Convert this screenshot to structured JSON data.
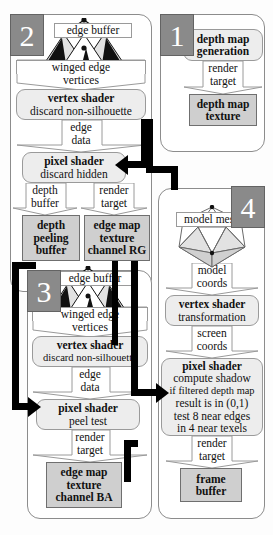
{
  "diagram": {
    "colors": {
      "stage_tab": "#8a8a8a",
      "buffer_fill": "#cfcfcf",
      "process_fill": "#ededed",
      "arrow": "#000000",
      "panel_border": "#8c8c8c"
    },
    "stages": [
      {
        "id": "stage-1",
        "number": "1"
      },
      {
        "id": "stage-2",
        "number": "2"
      },
      {
        "id": "stage-3",
        "number": "3"
      },
      {
        "id": "stage-4",
        "number": "4"
      }
    ]
  },
  "stage1": {
    "number": "1",
    "process": {
      "title": "depth map",
      "subtitle": "generation"
    },
    "connector": {
      "line1": "render",
      "line2": "target"
    },
    "buffer": {
      "line1": "depth map",
      "line2": "texture"
    }
  },
  "stage2": {
    "number": "2",
    "edge_buffer_label": "edge buffer",
    "mesh_label_1": "winged edge",
    "mesh_label_2": "vertices",
    "vertex_shader": {
      "title": "vertex shader",
      "subtitle": "discard non-silhouette"
    },
    "connector_edge": {
      "line1": "edge",
      "line2": "data"
    },
    "pixel_shader": {
      "title": "pixel shader",
      "subtitle": "discard hidden"
    },
    "connector_depth": {
      "line1": "depth",
      "line2": "buffer"
    },
    "connector_render": {
      "line1": "render",
      "line2": "target"
    },
    "buffer_depth_peeling": {
      "line1": "depth",
      "line2": "peeling",
      "line3": "buffer"
    },
    "buffer_edge_map_rg": {
      "line1": "edge map",
      "line2": "texture",
      "line3": "channel RG"
    }
  },
  "stage3": {
    "number": "3",
    "edge_buffer_label": "edge buffer",
    "mesh_label_1": "winged edge",
    "mesh_label_2": "vertices",
    "vertex_shader": {
      "title": "vertex shader",
      "subtitle": "discard non-silhouette"
    },
    "connector_edge": {
      "line1": "edge",
      "line2": "data"
    },
    "pixel_shader": {
      "title": "pixel shader",
      "subtitle": "peel test"
    },
    "connector_render": {
      "line1": "render",
      "line2": "target"
    },
    "buffer_edge_map_ba": {
      "line1": "edge map",
      "line2": "texture",
      "line3": "channel BA"
    }
  },
  "stage4": {
    "number": "4",
    "model_mesh_label": "model mesh",
    "connector_model": {
      "line1": "model",
      "line2": "coords"
    },
    "vertex_shader": {
      "title": "vertex shader",
      "subtitle": "transformation"
    },
    "connector_screen": {
      "line1": "screen",
      "line2": "coords"
    },
    "pixel_shader": {
      "title": "pixel shader",
      "line1": "compute shadow",
      "line2": "if filtered depth map",
      "line3": "result is in (0,1)",
      "line4": "test 8 near edges",
      "line5": "in 4 near texels"
    },
    "connector_render": {
      "line1": "render",
      "line2": "target"
    },
    "buffer_frame": {
      "line1": "frame",
      "line2": "buffer"
    }
  }
}
